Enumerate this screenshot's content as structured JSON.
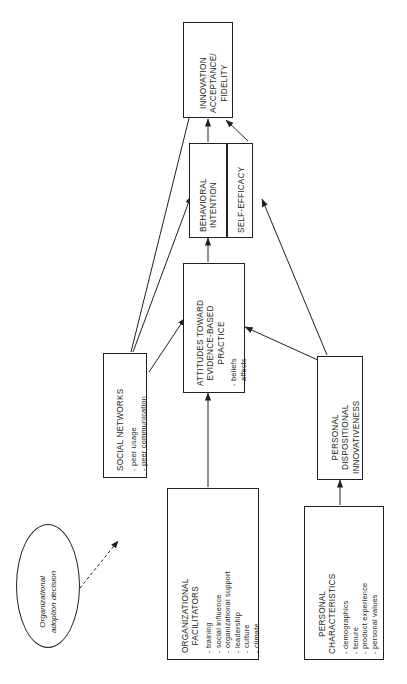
{
  "diagram": {
    "type": "conceptual-model-flowchart",
    "orientation": "rotated-90-ccw",
    "stroke_color": "#231f20",
    "background": "#ffffff",
    "nodes": [
      {
        "id": "innovation-acceptance-fidelity",
        "title": "INNOVATION\nACCEPTANCE/\nFIDELITY",
        "title_lines": [
          "INNOVATION",
          "ACCEPTANCE/",
          "FIDELITY"
        ],
        "bullets": [],
        "shape": "rectangle"
      },
      {
        "id": "behavioral-intention",
        "title_lines": [
          "BEHAVIORAL",
          "INTENTION"
        ],
        "bullets": [],
        "shape": "rectangle"
      },
      {
        "id": "self-efficacy",
        "title_lines": [
          "SELF-EFFICACY"
        ],
        "bullets": [],
        "shape": "rectangle"
      },
      {
        "id": "attitudes-toward-evidence-based-practice",
        "title_lines": [
          "ATTITUDES TOWARD",
          "EVIDENCE-BASED",
          "PRACTICE"
        ],
        "bullets": [
          "- beliefs",
          "- affects"
        ],
        "shape": "rectangle"
      },
      {
        "id": "social-networks",
        "title_lines": [
          "SOCIAL NETWORKS"
        ],
        "bullets": [
          "- peer usage",
          "- peer communication"
        ],
        "shape": "rectangle"
      },
      {
        "id": "organizational-facilitators",
        "title_lines": [
          "ORGANIZATIONAL",
          "FACILITATORS"
        ],
        "bullets": [
          "- training",
          "- social influence",
          "- organizational support",
          "- leadership",
          "- culture",
          "- climate"
        ],
        "shape": "rectangle"
      },
      {
        "id": "personal-dispositional-innovativeness",
        "title_lines": [
          "PERSONAL",
          "DISPOSITIONAL",
          "INNOVATIVENESS"
        ],
        "bullets": [],
        "shape": "rectangle"
      },
      {
        "id": "personal-characteristics",
        "title_lines": [
          "PERSONAL",
          "CHARACTERISTICS"
        ],
        "bullets": [
          "- demographics",
          "- tenure",
          "- product experience",
          "- personal values"
        ],
        "shape": "rectangle"
      },
      {
        "id": "organizational-adoption-decision",
        "title_lines": [
          "Organizational",
          "adoption decision"
        ],
        "bullets": [],
        "shape": "ellipse",
        "style": "italic"
      }
    ],
    "edges": [
      {
        "from": "behavioral-intention",
        "to": "innovation-acceptance-fidelity",
        "style": "solid"
      },
      {
        "from": "self-efficacy",
        "to": "innovation-acceptance-fidelity",
        "style": "solid"
      },
      {
        "from": "attitudes-toward-evidence-based-practice",
        "to": "behavioral-intention",
        "style": "solid"
      },
      {
        "from": "social-networks",
        "to": "innovation-acceptance-fidelity",
        "style": "solid"
      },
      {
        "from": "social-networks",
        "to": "behavioral-intention",
        "style": "solid"
      },
      {
        "from": "social-networks",
        "to": "attitudes-toward-evidence-based-practice",
        "style": "solid"
      },
      {
        "from": "organizational-facilitators",
        "to": "attitudes-toward-evidence-based-practice",
        "style": "solid"
      },
      {
        "from": "personal-dispositional-innovativeness",
        "to": "self-efficacy",
        "style": "solid"
      },
      {
        "from": "personal-dispositional-innovativeness",
        "to": "attitudes-toward-evidence-based-practice",
        "style": "solid"
      },
      {
        "from": "personal-characteristics",
        "to": "personal-dispositional-innovativeness",
        "style": "solid"
      },
      {
        "from": "organizational-adoption-decision",
        "to": "organizational-facilitators",
        "style": "dashed"
      }
    ],
    "labels": {
      "innovation_l1": "INNOVATION",
      "innovation_l2": "ACCEPTANCE/",
      "innovation_l3": "FIDELITY",
      "behavioral_l1": "BEHAVIORAL",
      "behavioral_l2": "INTENTION",
      "selfefficacy_l1": "SELF-EFFICACY",
      "attitudes_l1": "ATTITUDES TOWARD",
      "attitudes_l2": "EVIDENCE-BASED",
      "attitudes_l3": "PRACTICE",
      "attitudes_b1": "- beliefs",
      "attitudes_b2": "- affects",
      "social_l1": "SOCIAL NETWORKS",
      "social_b1": "- peer usage",
      "social_b2": "- peer communication",
      "orgfac_l1": "ORGANIZATIONAL",
      "orgfac_l2": "FACILITATORS",
      "orgfac_b1": "- training",
      "orgfac_b2": "- social influence",
      "orgfac_b3": "- organizational support",
      "orgfac_b4": "- leadership",
      "orgfac_b5": "- culture",
      "orgfac_b6": "- climate",
      "pdi_l1": "PERSONAL",
      "pdi_l2": "DISPOSITIONAL",
      "pdi_l3": "INNOVATIVENESS",
      "pc_l1": "PERSONAL",
      "pc_l2": "CHARACTERISTICS",
      "pc_b1": "- demographics",
      "pc_b2": "- tenure",
      "pc_b3": "- product experience",
      "pc_b4": "- personal values",
      "oval_l1": "Organizational",
      "oval_l2": "adoption decision"
    }
  }
}
